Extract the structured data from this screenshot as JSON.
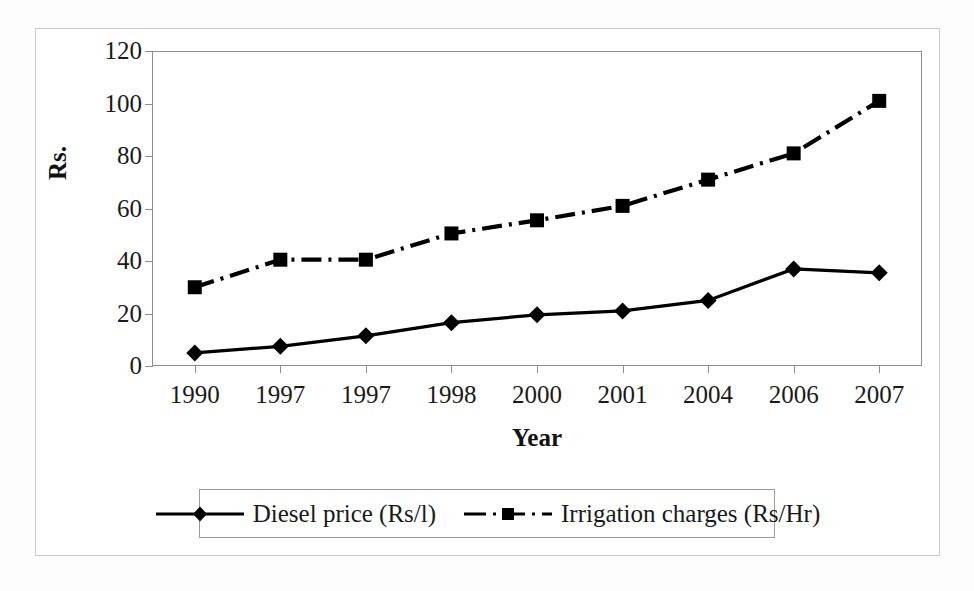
{
  "chart_data": {
    "type": "line",
    "title": "",
    "xlabel": "Year",
    "ylabel": "Rs.",
    "categories": [
      "1990",
      "1997",
      "1997",
      "1998",
      "2000",
      "2001",
      "2004",
      "2006",
      "2007"
    ],
    "ylim": [
      0,
      120
    ],
    "yticks": [
      0,
      20,
      40,
      60,
      80,
      100,
      120
    ],
    "ytick_labels": [
      "0",
      "20",
      "40",
      "60",
      "80",
      "100",
      "120"
    ],
    "grid": false,
    "legend_position": "bottom",
    "series": [
      {
        "name": "Diesel price (Rs/l)",
        "values": [
          5,
          7.5,
          11.5,
          16.5,
          19.5,
          21,
          25,
          37,
          35.5
        ],
        "marker": "diamond",
        "linestyle": "solid",
        "color": "#000000"
      },
      {
        "name": "Irrigation charges (Rs/Hr)",
        "values": [
          30,
          40.5,
          40.5,
          50.5,
          55.5,
          61,
          71,
          81,
          101
        ],
        "marker": "square",
        "linestyle": "dashdot",
        "color": "#000000"
      }
    ]
  },
  "legend": {
    "items": [
      {
        "label": "Diesel price (Rs/l)",
        "marker": "diamond-marker",
        "linestyle": "solid"
      },
      {
        "label": "Irrigation charges (Rs/Hr)",
        "marker": "square-marker",
        "linestyle": "dashdot"
      }
    ]
  },
  "colors": {
    "series": "#000000",
    "axis": "#8d8d8d",
    "frame": "#c9c9c9",
    "text": "#1a1a1a"
  }
}
